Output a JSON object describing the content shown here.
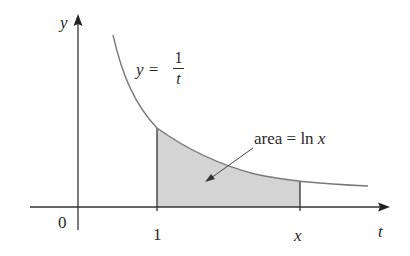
{
  "diagram": {
    "axes": {
      "horizontal_label": "t",
      "vertical_label": "y",
      "origin_label": "0"
    },
    "curve": {
      "equation_lhs": "y =",
      "numerator": "1",
      "denominator": "t"
    },
    "ticks": {
      "one": "1",
      "x": "x"
    },
    "annotation": {
      "text": "area = ln x",
      "text_plain": "area = ln ",
      "text_var": "x"
    },
    "colors": {
      "curve": "#7a7a7a",
      "axis": "#333333",
      "shade": "#d4d4d4",
      "text": "#2a2a2a"
    }
  }
}
